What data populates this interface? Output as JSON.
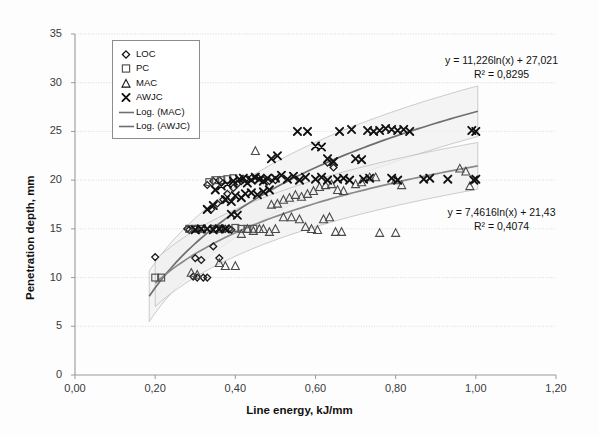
{
  "chart_data": {
    "type": "scatter",
    "title": "",
    "xlabel": "Line energy, kJ/mm",
    "ylabel": "Penetration depth, mm",
    "xlim": [
      0.0,
      1.2
    ],
    "ylim": [
      0,
      35
    ],
    "xticks": [
      "0,00",
      "0,20",
      "0,40",
      "0,60",
      "0,80",
      "1,00",
      "1,20"
    ],
    "xtick_values": [
      0.0,
      0.2,
      0.4,
      0.6,
      0.8,
      1.0,
      1.2
    ],
    "yticks": [
      "0",
      "5",
      "10",
      "15",
      "20",
      "25",
      "30",
      "35"
    ],
    "ytick_values": [
      0,
      5,
      10,
      15,
      20,
      25,
      30,
      35
    ],
    "grid": true,
    "grid_axis": "y",
    "legend_position": "upper-left",
    "series": [
      {
        "name": "LOC",
        "marker": "diamond",
        "color": "#1a1a1a",
        "points": [
          [
            0.2,
            12.1
          ],
          [
            0.28,
            15.0
          ],
          [
            0.285,
            14.9
          ],
          [
            0.3,
            15.0
          ],
          [
            0.31,
            14.9
          ],
          [
            0.3,
            12.0
          ],
          [
            0.315,
            11.8
          ],
          [
            0.295,
            10.1
          ],
          [
            0.305,
            10.0
          ],
          [
            0.32,
            10.0
          ],
          [
            0.33,
            10.0
          ],
          [
            0.345,
            13.2
          ],
          [
            0.36,
            12.0
          ],
          [
            0.35,
            15.0
          ],
          [
            0.365,
            15.0
          ],
          [
            0.375,
            15.0
          ],
          [
            0.385,
            15.0
          ],
          [
            0.39,
            14.9
          ],
          [
            0.34,
            17.0
          ],
          [
            0.355,
            17.6
          ],
          [
            0.37,
            18.0
          ],
          [
            0.38,
            18.6
          ],
          [
            0.395,
            19.2
          ],
          [
            0.405,
            19.6
          ],
          [
            0.415,
            19.9
          ],
          [
            0.425,
            20.1
          ],
          [
            0.44,
            20.2
          ],
          [
            0.455,
            20.3
          ],
          [
            0.47,
            20.0
          ],
          [
            0.485,
            19.9
          ],
          [
            0.5,
            20.0
          ],
          [
            0.33,
            19.5
          ],
          [
            0.345,
            19.9
          ],
          [
            0.36,
            20.0
          ],
          [
            0.63,
            21.8
          ],
          [
            0.645,
            21.3
          ]
        ]
      },
      {
        "name": "PC",
        "marker": "square",
        "color": "#555555",
        "points": [
          [
            0.2,
            10.0
          ],
          [
            0.215,
            10.0
          ],
          [
            0.285,
            15.0
          ],
          [
            0.3,
            15.0
          ],
          [
            0.315,
            15.0
          ],
          [
            0.35,
            15.0
          ],
          [
            0.365,
            15.0
          ],
          [
            0.4,
            15.1
          ],
          [
            0.415,
            15.0
          ],
          [
            0.43,
            15.0
          ],
          [
            0.445,
            15.0
          ],
          [
            0.335,
            19.8
          ],
          [
            0.35,
            20.0
          ],
          [
            0.365,
            20.0
          ],
          [
            0.38,
            20.1
          ],
          [
            0.395,
            20.2
          ]
        ]
      },
      {
        "name": "MAC",
        "marker": "triangle",
        "color": "#4a4a4a",
        "points": [
          [
            0.29,
            10.5
          ],
          [
            0.305,
            10.3
          ],
          [
            0.36,
            11.5
          ],
          [
            0.375,
            11.2
          ],
          [
            0.4,
            11.2
          ],
          [
            0.415,
            14.5
          ],
          [
            0.43,
            15.0
          ],
          [
            0.445,
            14.8
          ],
          [
            0.46,
            15.0
          ],
          [
            0.47,
            15.0
          ],
          [
            0.485,
            14.7
          ],
          [
            0.5,
            15.0
          ],
          [
            0.45,
            23.0
          ],
          [
            0.49,
            17.5
          ],
          [
            0.505,
            17.6
          ],
          [
            0.52,
            18.0
          ],
          [
            0.535,
            18.2
          ],
          [
            0.55,
            18.5
          ],
          [
            0.565,
            18.3
          ],
          [
            0.58,
            18.6
          ],
          [
            0.595,
            18.9
          ],
          [
            0.52,
            16.2
          ],
          [
            0.54,
            16.2
          ],
          [
            0.56,
            16.0
          ],
          [
            0.575,
            15.2
          ],
          [
            0.59,
            15.0
          ],
          [
            0.605,
            14.9
          ],
          [
            0.62,
            16.0
          ],
          [
            0.635,
            16.2
          ],
          [
            0.65,
            14.7
          ],
          [
            0.665,
            14.7
          ],
          [
            0.61,
            19.3
          ],
          [
            0.625,
            19.5
          ],
          [
            0.64,
            19.6
          ],
          [
            0.655,
            19.0
          ],
          [
            0.67,
            18.9
          ],
          [
            0.7,
            19.6
          ],
          [
            0.715,
            19.8
          ],
          [
            0.735,
            20.3
          ],
          [
            0.75,
            20.3
          ],
          [
            0.76,
            14.6
          ],
          [
            0.8,
            14.6
          ],
          [
            0.8,
            20.0
          ],
          [
            0.815,
            19.5
          ],
          [
            0.96,
            21.2
          ],
          [
            0.975,
            20.9
          ],
          [
            0.985,
            19.4
          ]
        ]
      },
      {
        "name": "AWJC",
        "marker": "cross",
        "color": "#111111",
        "points": [
          [
            0.3,
            14.9
          ],
          [
            0.315,
            15.0
          ],
          [
            0.33,
            15.0
          ],
          [
            0.345,
            14.9
          ],
          [
            0.36,
            15.0
          ],
          [
            0.375,
            15.0
          ],
          [
            0.33,
            17.0
          ],
          [
            0.345,
            17.4
          ],
          [
            0.39,
            16.5
          ],
          [
            0.405,
            16.4
          ],
          [
            0.35,
            19.0
          ],
          [
            0.365,
            19.4
          ],
          [
            0.38,
            19.6
          ],
          [
            0.395,
            19.9
          ],
          [
            0.41,
            20.1
          ],
          [
            0.42,
            20.2
          ],
          [
            0.43,
            19.7
          ],
          [
            0.44,
            20.0
          ],
          [
            0.45,
            20.3
          ],
          [
            0.46,
            20.1
          ],
          [
            0.47,
            19.9
          ],
          [
            0.48,
            20.2
          ],
          [
            0.4,
            18.4
          ],
          [
            0.415,
            18.2
          ],
          [
            0.425,
            18.6
          ],
          [
            0.44,
            18.7
          ],
          [
            0.455,
            18.5
          ],
          [
            0.47,
            18.8
          ],
          [
            0.485,
            19.0
          ],
          [
            0.375,
            18.0
          ],
          [
            0.39,
            17.8
          ],
          [
            0.5,
            20.2
          ],
          [
            0.515,
            20.5
          ],
          [
            0.53,
            20.1
          ],
          [
            0.545,
            20.4
          ],
          [
            0.56,
            20.0
          ],
          [
            0.575,
            20.3
          ],
          [
            0.49,
            22.2
          ],
          [
            0.505,
            22.5
          ],
          [
            0.555,
            25.0
          ],
          [
            0.58,
            25.0
          ],
          [
            0.6,
            23.5
          ],
          [
            0.615,
            23.4
          ],
          [
            0.63,
            22.2
          ],
          [
            0.645,
            21.9
          ],
          [
            0.6,
            20.1
          ],
          [
            0.615,
            20.3
          ],
          [
            0.63,
            20.0
          ],
          [
            0.655,
            20.1
          ],
          [
            0.67,
            20.2
          ],
          [
            0.685,
            20.0
          ],
          [
            0.66,
            25.0
          ],
          [
            0.69,
            25.2
          ],
          [
            0.7,
            22.2
          ],
          [
            0.715,
            22.1
          ],
          [
            0.73,
            25.1
          ],
          [
            0.745,
            25.0
          ],
          [
            0.76,
            25.1
          ],
          [
            0.775,
            25.3
          ],
          [
            0.79,
            25.2
          ],
          [
            0.805,
            25.1
          ],
          [
            0.82,
            25.2
          ],
          [
            0.835,
            25.0
          ],
          [
            0.72,
            20.1
          ],
          [
            0.735,
            20.2
          ],
          [
            0.79,
            20.2
          ],
          [
            0.805,
            20.0
          ],
          [
            0.87,
            20.1
          ],
          [
            0.885,
            20.2
          ],
          [
            0.93,
            20.1
          ],
          [
            0.99,
            25.1
          ],
          [
            1.0,
            25.0
          ],
          [
            0.995,
            20.0
          ],
          [
            1.0,
            20.1
          ]
        ]
      }
    ],
    "trendlines": [
      {
        "name": "Log. (AWJC)",
        "equation_text": "y = 11,226ln(x) + 27,021",
        "r2_text": "R² = 0,8295",
        "slope": 11.226,
        "intercept": 27.021,
        "r2": 0.8295,
        "form": "logarithmic",
        "band": true,
        "color": "#6f6f6f",
        "label_x": 0.82,
        "label_y": 31.5
      },
      {
        "name": "Log. (MAC)",
        "equation_text": "y = 7,4616ln(x) + 21,43",
        "r2_text": "R² = 0,4074",
        "slope": 7.4616,
        "intercept": 21.43,
        "r2": 0.4074,
        "form": "logarithmic",
        "band": true,
        "color": "#8a8a8a",
        "label_x": 0.84,
        "label_y": 17.6
      }
    ],
    "legend": [
      {
        "label": "LOC",
        "marker": "diamond"
      },
      {
        "label": "PC",
        "marker": "square"
      },
      {
        "label": "MAC",
        "marker": "triangle"
      },
      {
        "label": "AWJC",
        "marker": "cross"
      },
      {
        "label": "Log. (MAC)",
        "marker": "line"
      },
      {
        "label": "Log. (AWJC)",
        "marker": "line"
      }
    ]
  }
}
